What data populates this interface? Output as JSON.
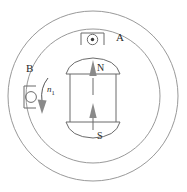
{
  "figure": {
    "type": "dc-machine-cross-section",
    "title": "",
    "background_color": "#ffffff",
    "line_color": "#8d8d8d",
    "label_color": "#2b2b2b",
    "arrow_color": "#8a8a8a"
  },
  "stator": {
    "outer_circle_label": "stator-outer-circle",
    "inner_circle_label": "stator-inner-circle",
    "outer_radius": 88,
    "inner_radius": 70,
    "center_x": 93,
    "center_y": 96
  },
  "rotor": {
    "name": "rotor-magnet",
    "north_pole_label": "N",
    "south_pole_label": "S",
    "flux_direction": "upward"
  },
  "conductors": [
    {
      "id": "A",
      "label": "A",
      "symbol": "dot",
      "symbol_meaning": "current-out-of-page",
      "position": "top"
    },
    {
      "id": "B",
      "label": "B",
      "symbol": "circle",
      "symbol_meaning": "current-into-page",
      "position": "left"
    }
  ],
  "rotation": {
    "label": "n",
    "subscript": "1",
    "direction": "counterclockwise"
  }
}
